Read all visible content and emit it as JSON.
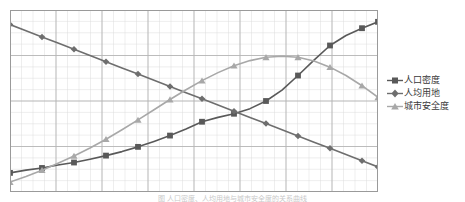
{
  "figure": {
    "caption": "图 人口密度、人均用地与城市安全度的关系曲线",
    "plot": {
      "border_color": "#9a9a9a",
      "minor_grid_color": "#dcdcdc",
      "major_grid_color": "#b5b5b5",
      "background": "#ffffff"
    }
  },
  "legend": {
    "position": "right",
    "entries": [
      {
        "label": "人口密度",
        "marker": "square",
        "color": "#595959"
      },
      {
        "label": "人均用地",
        "marker": "diamond",
        "color": "#6e6e6e"
      },
      {
        "label": "城市安全度",
        "marker": "triangle",
        "color": "#a8a8a8"
      }
    ]
  },
  "chart_data": {
    "type": "line",
    "title": "",
    "xlabel": "",
    "ylabel": "",
    "xlim": [
      0,
      23
    ],
    "ylim": [
      0,
      10
    ],
    "grid": true,
    "minor_grid_divisions": 4,
    "legend_position": "right",
    "x": [
      0,
      1,
      2,
      3,
      4,
      5,
      6,
      7,
      8,
      9,
      10,
      11,
      12,
      13,
      14,
      15,
      16,
      17,
      18,
      19,
      20,
      21,
      22,
      23
    ],
    "series": [
      {
        "name": "人口密度",
        "marker": "square",
        "color": "#595959",
        "values": [
          1.05,
          1.2,
          1.32,
          1.48,
          1.62,
          1.8,
          2.0,
          2.22,
          2.48,
          2.78,
          3.1,
          3.46,
          3.86,
          4.1,
          4.3,
          4.58,
          5.0,
          5.6,
          6.4,
          7.25,
          8.05,
          8.6,
          9.0,
          9.35
        ]
      },
      {
        "name": "人均用地",
        "marker": "diamond",
        "color": "#6e6e6e",
        "values": [
          9.2,
          8.86,
          8.52,
          8.18,
          7.84,
          7.5,
          7.16,
          6.82,
          6.48,
          6.14,
          5.8,
          5.46,
          5.12,
          4.78,
          4.44,
          4.1,
          3.76,
          3.42,
          3.08,
          2.74,
          2.4,
          2.06,
          1.72,
          1.38
        ]
      },
      {
        "name": "城市安全度",
        "marker": "triangle",
        "color": "#a8a8a8",
        "values": [
          0.55,
          0.85,
          1.2,
          1.58,
          1.98,
          2.42,
          2.9,
          3.42,
          3.96,
          4.52,
          5.08,
          5.62,
          6.12,
          6.56,
          6.94,
          7.22,
          7.4,
          7.46,
          7.4,
          7.2,
          6.86,
          6.4,
          5.84,
          5.2
        ]
      }
    ]
  }
}
